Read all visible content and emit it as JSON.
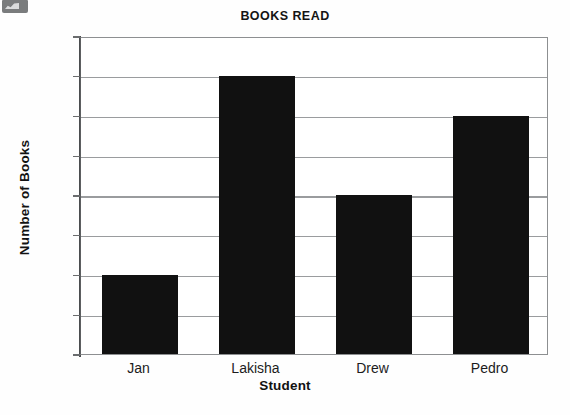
{
  "chart_data": {
    "type": "bar",
    "title": "BOOKS READ",
    "xlabel": "Student",
    "ylabel": "Number of Books",
    "categories": [
      "Jan",
      "Lakisha",
      "Drew",
      "Pedro"
    ],
    "values": [
      2,
      7,
      4,
      6
    ],
    "ylim": [
      0,
      8
    ],
    "yticks": [
      0,
      1,
      2,
      3,
      4,
      5,
      6,
      7,
      8
    ],
    "ytick_labels": [
      "0",
      "1",
      "2",
      "3",
      "4",
      "5",
      "6",
      "7",
      "8"
    ],
    "grid": true,
    "grid_axis": "y",
    "legend": false,
    "legend_position": "none",
    "bar_color": "#111111",
    "background_color": "#ffffff",
    "axis_color": "#4a4c4e",
    "gridline_color": "#9a9c9e"
  },
  "artifact": {
    "name": "scan-thumbnail-artifact"
  }
}
